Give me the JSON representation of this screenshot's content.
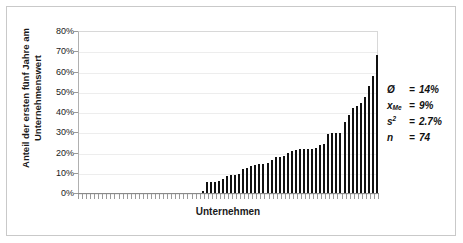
{
  "figure": {
    "watermark": ""
  },
  "chart_data": {
    "type": "bar",
    "title": "",
    "xlabel": "Unternehmen",
    "ylabel_lines": [
      "Anteil der ersten fünf Jahre am",
      "Unternehmenswert"
    ],
    "ylabel": "Anteil der ersten fünf Jahre am Unternehmenswert",
    "ylim": [
      0,
      80
    ],
    "ytick_labels": [
      "0%",
      "10%",
      "20%",
      "30%",
      "40%",
      "50%",
      "60%",
      "70%",
      "80%"
    ],
    "ytick_values": [
      0,
      10,
      20,
      30,
      40,
      50,
      60,
      70,
      80
    ],
    "grid": true,
    "legend": "none",
    "xtick_labels": [],
    "categories": [
      "1",
      "2",
      "3",
      "4",
      "5",
      "6",
      "7",
      "8",
      "9",
      "10",
      "11",
      "12",
      "13",
      "14",
      "15",
      "16",
      "17",
      "18",
      "19",
      "20",
      "21",
      "22",
      "23",
      "24",
      "25",
      "26",
      "27",
      "28",
      "29",
      "30",
      "31",
      "32",
      "33",
      "34",
      "35",
      "36",
      "37",
      "38",
      "39",
      "40",
      "41",
      "42",
      "43",
      "44",
      "45",
      "46",
      "47",
      "48",
      "49",
      "50",
      "51",
      "52",
      "53",
      "54",
      "55",
      "56",
      "57",
      "58",
      "59",
      "60",
      "61",
      "62",
      "63",
      "64",
      "65",
      "66",
      "67",
      "68",
      "69",
      "70",
      "71",
      "72",
      "73",
      "74"
    ],
    "values": [
      0,
      0,
      0,
      0,
      0,
      0,
      0,
      0,
      0,
      0,
      0,
      0,
      0,
      0,
      0,
      0,
      0,
      0,
      0,
      0,
      0,
      0,
      0,
      0,
      0,
      0,
      0,
      0,
      0,
      0,
      0.8,
      5.2,
      5.2,
      5.6,
      6.0,
      7.0,
      8.6,
      8.8,
      9.0,
      9.3,
      11.8,
      12.6,
      13.2,
      13.6,
      14.3,
      14.5,
      14.6,
      16.5,
      17.6,
      18.0,
      18.2,
      19.8,
      20.6,
      21.2,
      21.5,
      21.6,
      21.6,
      21.7,
      22.2,
      23.5,
      24.0,
      29.0,
      29.5,
      29.6,
      29.8,
      35.0,
      38.5,
      41.8,
      42.8,
      44.5,
      47.4,
      52.8,
      57.6,
      68.2
    ]
  },
  "stats": {
    "rows": [
      {
        "symbol": "Ø",
        "sub": "",
        "sup": "",
        "eq": "=",
        "value": "14%"
      },
      {
        "symbol": "x",
        "sub": "Me",
        "sup": "",
        "eq": "=",
        "value": "9%"
      },
      {
        "symbol": "s",
        "sub": "",
        "sup": "2",
        "eq": "=",
        "value": "2.7%"
      },
      {
        "symbol": "n",
        "sub": "",
        "sup": "",
        "eq": "=",
        "value": "74"
      }
    ]
  }
}
